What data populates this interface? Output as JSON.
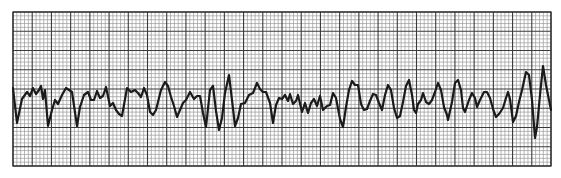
{
  "chart_data": {
    "type": "line",
    "title": "",
    "subtitle": "",
    "xlabel": "",
    "ylabel": "",
    "grid": {
      "on": true,
      "left": 13,
      "top": 12,
      "right": 551,
      "bottom": 166,
      "major_cols": 28,
      "major_rows": 8,
      "minor_per_major": 5
    },
    "colors": {
      "background": "#ffffff",
      "minor_grid": "#9a9a9a",
      "major_grid": "#3a3a3a",
      "trace": "#1a1a1a"
    },
    "series": [
      {
        "name": "ECG trace",
        "points": [
          [
            13,
            88
          ],
          [
            17,
            123
          ],
          [
            22,
            99
          ],
          [
            27,
            92
          ],
          [
            30,
            96
          ],
          [
            33,
            88
          ],
          [
            36,
            94
          ],
          [
            39,
            90
          ],
          [
            41,
            86
          ],
          [
            43,
            99
          ],
          [
            45,
            90
          ],
          [
            48,
            126
          ],
          [
            52,
            110
          ],
          [
            55,
            100
          ],
          [
            58,
            104
          ],
          [
            62,
            95
          ],
          [
            66,
            88
          ],
          [
            69,
            90
          ],
          [
            72,
            92
          ],
          [
            77,
            126
          ],
          [
            80,
            107
          ],
          [
            84,
            95
          ],
          [
            88,
            92
          ],
          [
            91,
            100
          ],
          [
            94,
            100
          ],
          [
            97,
            91
          ],
          [
            100,
            98
          ],
          [
            103,
            96
          ],
          [
            106,
            87
          ],
          [
            110,
            106
          ],
          [
            113,
            103
          ],
          [
            116,
            110
          ],
          [
            119,
            114
          ],
          [
            122,
            116
          ],
          [
            127,
            88
          ],
          [
            131,
            92
          ],
          [
            135,
            90
          ],
          [
            138,
            93
          ],
          [
            141,
            97
          ],
          [
            144,
            88
          ],
          [
            147,
            95
          ],
          [
            150,
            112
          ],
          [
            153,
            115
          ],
          [
            156,
            110
          ],
          [
            161,
            90
          ],
          [
            165,
            82
          ],
          [
            168,
            86
          ],
          [
            171,
            97
          ],
          [
            174,
            106
          ],
          [
            177,
            117
          ],
          [
            180,
            110
          ],
          [
            183,
            103
          ],
          [
            186,
            100
          ],
          [
            190,
            92
          ],
          [
            194,
            99
          ],
          [
            197,
            96
          ],
          [
            200,
            96
          ],
          [
            203,
            113
          ],
          [
            206,
            127
          ],
          [
            210,
            90
          ],
          [
            213,
            86
          ],
          [
            216,
            111
          ],
          [
            219,
            130
          ],
          [
            222,
            118
          ],
          [
            225,
            93
          ],
          [
            229,
            75
          ],
          [
            232,
            100
          ],
          [
            235,
            126
          ],
          [
            238,
            118
          ],
          [
            241,
            104
          ],
          [
            245,
            103
          ],
          [
            249,
            95
          ],
          [
            253,
            93
          ],
          [
            257,
            83
          ],
          [
            260,
            89
          ],
          [
            263,
            92
          ],
          [
            266,
            92
          ],
          [
            270,
            103
          ],
          [
            273,
            123
          ],
          [
            276,
            105
          ],
          [
            279,
            98
          ],
          [
            282,
            99
          ],
          [
            285,
            95
          ],
          [
            288,
            101
          ],
          [
            290,
            94
          ],
          [
            293,
            104
          ],
          [
            296,
            101
          ],
          [
            298,
            95
          ],
          [
            302,
            112
          ],
          [
            305,
            103
          ],
          [
            308,
            113
          ],
          [
            311,
            103
          ],
          [
            314,
            99
          ],
          [
            317,
            106
          ],
          [
            320,
            96
          ],
          [
            323,
            110
          ],
          [
            327,
            106
          ],
          [
            330,
            105
          ],
          [
            333,
            93
          ],
          [
            336,
            98
          ],
          [
            340,
            119
          ],
          [
            343,
            127
          ],
          [
            346,
            107
          ],
          [
            349,
            90
          ],
          [
            352,
            81
          ],
          [
            355,
            85
          ],
          [
            358,
            85
          ],
          [
            361,
            104
          ],
          [
            364,
            110
          ],
          [
            367,
            109
          ],
          [
            370,
            101
          ],
          [
            373,
            94
          ],
          [
            376,
            95
          ],
          [
            379,
            103
          ],
          [
            382,
            110
          ],
          [
            385,
            95
          ],
          [
            388,
            85
          ],
          [
            391,
            90
          ],
          [
            394,
            108
          ],
          [
            397,
            118
          ],
          [
            400,
            116
          ],
          [
            403,
            102
          ],
          [
            406,
            86
          ],
          [
            409,
            80
          ],
          [
            412,
            95
          ],
          [
            414,
            110
          ],
          [
            416,
            113
          ],
          [
            418,
            104
          ],
          [
            421,
            100
          ],
          [
            423,
            93
          ],
          [
            426,
            102
          ],
          [
            429,
            104
          ],
          [
            432,
            100
          ],
          [
            435,
            92
          ],
          [
            438,
            83
          ],
          [
            441,
            90
          ],
          [
            444,
            107
          ],
          [
            447,
            115
          ],
          [
            448,
            120
          ],
          [
            452,
            102
          ],
          [
            455,
            83
          ],
          [
            458,
            80
          ],
          [
            461,
            90
          ],
          [
            463,
            108
          ],
          [
            465,
            112
          ],
          [
            469,
            100
          ],
          [
            472,
            93
          ],
          [
            475,
            98
          ],
          [
            477,
            107
          ],
          [
            480,
            100
          ],
          [
            484,
            92
          ],
          [
            487,
            92
          ],
          [
            490,
            98
          ],
          [
            493,
            109
          ],
          [
            496,
            117
          ],
          [
            499,
            114
          ],
          [
            503,
            108
          ],
          [
            506,
            98
          ],
          [
            508,
            92
          ],
          [
            510,
            99
          ],
          [
            513,
            122
          ],
          [
            516,
            116
          ],
          [
            519,
            102
          ],
          [
            522,
            90
          ],
          [
            526,
            72
          ],
          [
            529,
            75
          ],
          [
            532,
            100
          ],
          [
            535,
            138
          ],
          [
            537,
            127
          ],
          [
            540,
            95
          ],
          [
            543,
            66
          ],
          [
            546,
            85
          ],
          [
            549,
            100
          ],
          [
            551,
            110
          ]
        ]
      }
    ],
    "legend": [],
    "annotations": []
  }
}
